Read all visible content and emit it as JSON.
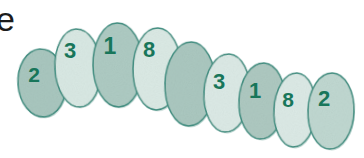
{
  "figure": {
    "type": "tooth-chart",
    "width": 364,
    "height": 158,
    "background_color": "#ffffff",
    "partial_text": {
      "label": "e",
      "description": "clipped letter from adjacent text",
      "color": "#1c1c1c",
      "x": -4,
      "y": 2,
      "font_size": 34
    },
    "palette": {
      "outline": "#3f8e80",
      "fill_dark": "#a9c7bf",
      "fill_light": "#d9e9e4",
      "fill_medium": "#c2dad3",
      "digit": "#18765a",
      "shadow": "#bcd4cd"
    },
    "teeth": [
      {
        "id": "tooth-1",
        "label": "2",
        "cx": 42,
        "cy": 83,
        "rx": 24,
        "ry": 34,
        "rotation": -4,
        "shade": "dark",
        "fill": "#a9c7bf",
        "digit_x": 34,
        "digit_y": 76,
        "digit_size": 21
      },
      {
        "id": "tooth-2",
        "label": "3",
        "cx": 78,
        "cy": 68,
        "rx": 23,
        "ry": 39,
        "rotation": -3,
        "shade": "light",
        "fill": "#d9e9e4",
        "digit_x": 70,
        "digit_y": 52,
        "digit_size": 22
      },
      {
        "id": "tooth-3",
        "label": "1",
        "cx": 118,
        "cy": 65,
        "rx": 25,
        "ry": 42,
        "rotation": -1,
        "shade": "dark",
        "fill": "#aecbc3",
        "digit_x": 110,
        "digit_y": 48,
        "digit_size": 23
      },
      {
        "id": "tooth-4",
        "label": "8",
        "cx": 157,
        "cy": 69,
        "rx": 24,
        "ry": 41,
        "rotation": 1,
        "shade": "light",
        "fill": "#dbeae5",
        "digit_x": 149,
        "digit_y": 51,
        "digit_size": 22
      },
      {
        "id": "tooth-5",
        "label": "",
        "cx": 190,
        "cy": 84,
        "rx": 25,
        "ry": 42,
        "rotation": 2,
        "shade": "dark",
        "fill": "#abc8c0",
        "digit_x": 0,
        "digit_y": 0,
        "digit_size": 0
      },
      {
        "id": "tooth-6",
        "label": "3",
        "cx": 227,
        "cy": 93,
        "rx": 23,
        "ry": 39,
        "rotation": 3,
        "shade": "light",
        "fill": "#dceae6",
        "digit_x": 219,
        "digit_y": 83,
        "digit_size": 22
      },
      {
        "id": "tooth-7",
        "label": "1",
        "cx": 262,
        "cy": 101,
        "rx": 23,
        "ry": 38,
        "rotation": 3,
        "shade": "dark",
        "fill": "#aec9c1",
        "digit_x": 255,
        "digit_y": 92,
        "digit_size": 22
      },
      {
        "id": "tooth-8",
        "label": "8",
        "cx": 295,
        "cy": 110,
        "rx": 21,
        "ry": 37,
        "rotation": 3,
        "shade": "light",
        "fill": "#dceae6",
        "digit_x": 288,
        "digit_y": 101,
        "digit_size": 21
      },
      {
        "id": "tooth-9",
        "label": "2",
        "cx": 331,
        "cy": 111,
        "rx": 23,
        "ry": 38,
        "rotation": 2,
        "shade": "medium",
        "fill": "#c0d8d1",
        "digit_x": 324,
        "digit_y": 100,
        "digit_size": 22
      }
    ]
  }
}
